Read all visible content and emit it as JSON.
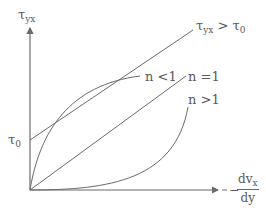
{
  "diagram": {
    "y_axis": {
      "symbol": "τ",
      "subscript": "yx"
    },
    "x_axis": {
      "prefix": "−",
      "numerator": "dv",
      "numerator_subscript": "x",
      "denominator": "dy"
    },
    "intercept_label": {
      "symbol": "τ",
      "subscript": "0"
    },
    "curves": [
      {
        "id": "bingham",
        "label_main": "τ",
        "label_sub": "yx",
        "label_rest": " > τ",
        "label_rest_sub": "0"
      },
      {
        "id": "shear-thinning",
        "label": "n <1"
      },
      {
        "id": "newtonian",
        "label": "n =1"
      },
      {
        "id": "shear-thickening",
        "label": "n >1"
      }
    ],
    "colors": {
      "line": "#6a6a6a",
      "text": "#5a5a5a"
    }
  }
}
